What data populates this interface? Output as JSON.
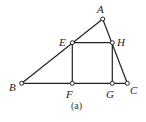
{
  "figure": {
    "caption": "(a)",
    "points": {
      "A": {
        "label": "A",
        "x": 102.7,
        "y": 19
      },
      "B": {
        "label": "B",
        "x": 21.7,
        "y": 83.3
      },
      "C": {
        "label": "C",
        "x": 127.3,
        "y": 83.3
      },
      "E": {
        "label": "E",
        "x": 72.3,
        "y": 42.7
      },
      "F": {
        "label": "F",
        "x": 72.3,
        "y": 83.3
      },
      "G": {
        "label": "G",
        "x": 112.3,
        "y": 83.3
      },
      "H": {
        "label": "H",
        "x": 112.3,
        "y": 42.7
      }
    },
    "segments": [
      "AB",
      "AC",
      "BC",
      "EH",
      "EF",
      "HG"
    ],
    "shapes": [
      "triangle ABC",
      "rectangle EFGH inscribed with E on AB, H on AC, F and G on BC"
    ]
  }
}
